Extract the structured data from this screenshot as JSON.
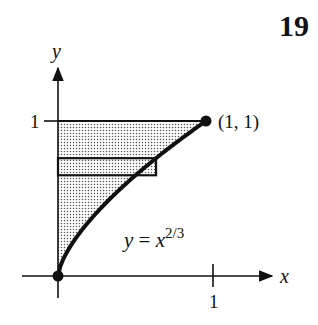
{
  "page_number": "19",
  "axes": {
    "x_label": "x",
    "y_label": "y",
    "x_tick_label": "1",
    "y_tick_label": "1"
  },
  "curve": {
    "equation_base": "y = x",
    "equation_exponent": "2/3",
    "exponent": 0.6667
  },
  "points": {
    "end_label": "(1, 1)",
    "end_x": 1,
    "end_y": 1,
    "origin_x": 0,
    "origin_y": 0
  },
  "strip": {
    "y_bottom": 0.65,
    "y_top": 0.76
  },
  "colors": {
    "ink": "#111111",
    "shade": "#9a9a9a"
  }
}
